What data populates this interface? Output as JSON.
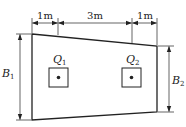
{
  "diagram": {
    "type": "trapezoidal-combined-footing-plan",
    "colors": {
      "stroke": "#222222",
      "background": "#ffffff"
    },
    "top_dimensions": [
      {
        "label": "1m"
      },
      {
        "label": "3m"
      },
      {
        "label": "1m"
      }
    ],
    "columns": [
      {
        "symbol": "Q",
        "subscript": "1"
      },
      {
        "symbol": "Q",
        "subscript": "2"
      }
    ],
    "widths": {
      "left": {
        "symbol": "B",
        "subscript": "1"
      },
      "right": {
        "symbol": "B",
        "subscript": "2"
      }
    }
  }
}
